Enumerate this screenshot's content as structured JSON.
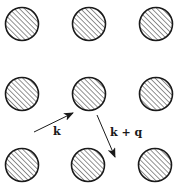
{
  "diagram": {
    "lattice": {
      "rows": 3,
      "cols": 3,
      "atom_radius": 16.5,
      "atom_fill": "hatched",
      "atoms": [
        {
          "row": 0,
          "col": 0,
          "cx": 22,
          "cy": 24
        },
        {
          "row": 0,
          "col": 1,
          "cx": 89,
          "cy": 24
        },
        {
          "row": 0,
          "col": 2,
          "cx": 156,
          "cy": 24
        },
        {
          "row": 1,
          "col": 0,
          "cx": 22,
          "cy": 94
        },
        {
          "row": 1,
          "col": 1,
          "cx": 89,
          "cy": 94
        },
        {
          "row": 1,
          "col": 2,
          "cx": 156,
          "cy": 94
        },
        {
          "row": 2,
          "col": 0,
          "cx": 22,
          "cy": 165
        },
        {
          "row": 2,
          "col": 1,
          "cx": 88,
          "cy": 165
        },
        {
          "row": 2,
          "col": 2,
          "cx": 155,
          "cy": 165
        }
      ]
    },
    "arrows": [
      {
        "name": "incident",
        "label": "k",
        "x1": 34,
        "y1": 132,
        "x2": 73,
        "y2": 113,
        "label_x": 53,
        "label_y": 135
      },
      {
        "name": "scattered",
        "label": "k + q",
        "x1": 97,
        "y1": 115,
        "x2": 115,
        "y2": 157,
        "label_x": 110,
        "label_y": 136
      }
    ],
    "colors": {
      "stroke": "#1a1a1a",
      "hatch": "#3a3a3a",
      "background": "#ffffff"
    }
  }
}
